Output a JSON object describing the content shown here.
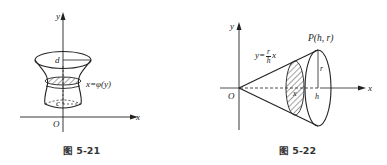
{
  "figures": [
    {
      "id": "fig-5-21",
      "caption": "图 5-21",
      "labels": {
        "y_axis": "y",
        "x_axis": "x",
        "origin": "O",
        "top_level": "d",
        "bottom_level": "c",
        "curve_equation": "x=φ(y)"
      },
      "description": "Solid of revolution about the y-axis between y=c and y=d, generated by the curve x=φ(y); shaded cross-section disk."
    },
    {
      "id": "fig-5-22",
      "caption": "图 5-22",
      "labels": {
        "y_axis": "y",
        "x_axis": "x",
        "origin": "O",
        "point": "P(h, r)",
        "line_eq_prefix": "y=",
        "line_eq_num": "r",
        "line_eq_den": "h",
        "line_eq_suffix": "x",
        "radius": "r",
        "height": "h",
        "section_x": "x"
      },
      "description": "Cone obtained by rotating the line y=(r/h)x about the x-axis, with apex at O and base at x=h; shaded cross-section disk at x."
    }
  ],
  "colors": {
    "line": "#222222",
    "hatch": "#333333",
    "background": "#ffffff"
  }
}
